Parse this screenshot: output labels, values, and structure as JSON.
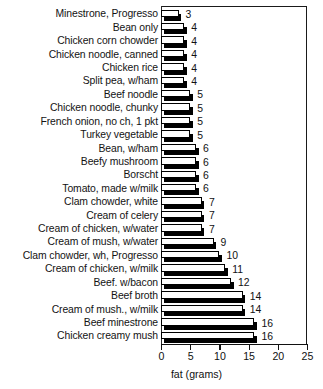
{
  "chart_data": {
    "type": "bar",
    "orientation": "horizontal",
    "title": "",
    "xlabel": "fat (grams)",
    "ylabel": "",
    "xlim": [
      0,
      25
    ],
    "xticks": [
      0,
      5,
      10,
      15,
      20,
      25
    ],
    "grid": false,
    "legend": null,
    "value_labels": true,
    "categories": [
      "Minestrone, Progresso",
      "Bean only",
      "Chicken corn chowder",
      "Chicken noodle, canned",
      "Chicken rice",
      "Split pea, w/ham",
      "Beef noodle",
      "Chicken noodle, chunky",
      "French onion, no ch, 1 pkt",
      "Turkey vegetable",
      "Bean, w/ham",
      "Beefy mushroom",
      "Borscht",
      "Tomato, made w/milk",
      "Clam chowder, white",
      "Cream of celery",
      "Cream of chicken, w/water",
      "Cream of mush, w/water",
      "Clam chowder, wh, Progresso",
      "Cream of chicken, w/milk",
      "Beef. w/bacon",
      "Beef broth",
      "Cream of mush., w/milk",
      "Beef minestrone",
      "Chicken creamy mush"
    ],
    "values": [
      3,
      4,
      4,
      4,
      4,
      4,
      5,
      5,
      5,
      5,
      6,
      6,
      6,
      6,
      7,
      7,
      7,
      9,
      10,
      11,
      12,
      14,
      14,
      16,
      16
    ],
    "value_label_text": [
      "3",
      "4",
      "4",
      "4",
      "4",
      "4",
      "5",
      "5",
      "5",
      "5",
      "6",
      "6",
      "6",
      "6",
      "7",
      "7",
      "7",
      "9",
      "10",
      "11",
      "12",
      "14",
      "14",
      "16",
      "16"
    ],
    "colors": {
      "bar_face": "#ffffff",
      "bar_outline": "#000000",
      "bar_shadow": "#000000",
      "axis": "#111111",
      "text": "#111111",
      "background": "#ffffff"
    }
  }
}
